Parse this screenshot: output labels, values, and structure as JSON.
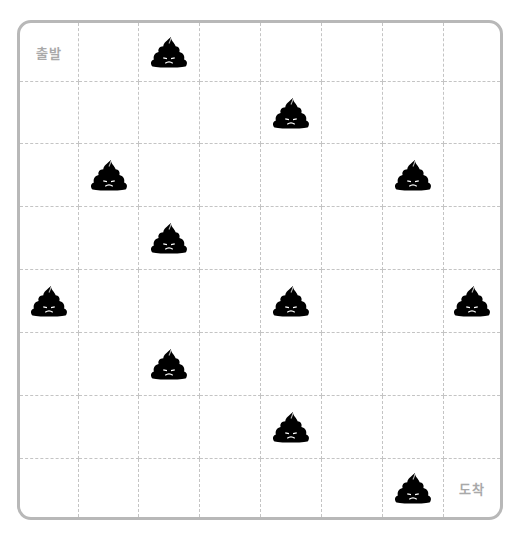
{
  "board": {
    "rows": 8,
    "cols": 8,
    "start_label": "출발",
    "end_label": "도착",
    "start_cell": [
      0,
      0
    ],
    "end_cell": [
      7,
      7
    ],
    "obstacle_icon": "poop-icon",
    "obstacles": [
      [
        0,
        2
      ],
      [
        1,
        4
      ],
      [
        2,
        1
      ],
      [
        2,
        6
      ],
      [
        3,
        2
      ],
      [
        4,
        0
      ],
      [
        4,
        4
      ],
      [
        4,
        7
      ],
      [
        5,
        2
      ],
      [
        6,
        4
      ],
      [
        7,
        6
      ]
    ],
    "colors": {
      "border": "#b8b8b8",
      "grid": "#c4c4c4",
      "label": "#a9a9a9",
      "icon": "#000000"
    }
  }
}
